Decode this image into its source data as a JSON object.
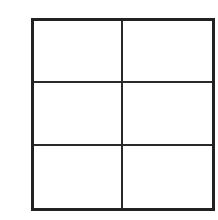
{
  "diagram": {
    "type": "grid",
    "rows": 3,
    "columns": 2,
    "line_color": "#222222",
    "background": "#ffffff",
    "cells": [
      {
        "row": 0,
        "col": 0,
        "label": ""
      },
      {
        "row": 0,
        "col": 1,
        "label": ""
      },
      {
        "row": 1,
        "col": 0,
        "label": ""
      },
      {
        "row": 1,
        "col": 1,
        "label": ""
      },
      {
        "row": 2,
        "col": 0,
        "label": ""
      },
      {
        "row": 2,
        "col": 1,
        "label": ""
      }
    ]
  }
}
